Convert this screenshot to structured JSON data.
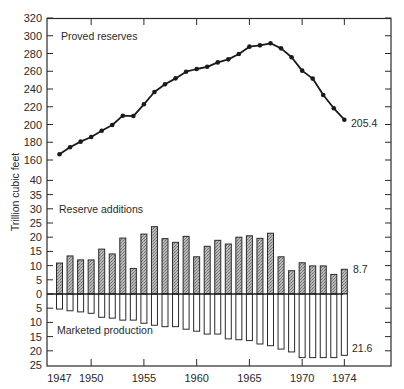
{
  "chart_data": {
    "type": "line+bar",
    "title": "",
    "ylabel": "Trillion cubic feet",
    "xlabel": "",
    "x_tick_labels": [
      "1947",
      "1950",
      "1955",
      "1960",
      "1965",
      "1970",
      "1974"
    ],
    "x": [
      1947,
      1948,
      1949,
      1950,
      1951,
      1952,
      1953,
      1954,
      1955,
      1956,
      1957,
      1958,
      1959,
      1960,
      1961,
      1962,
      1963,
      1964,
      1965,
      1966,
      1967,
      1968,
      1969,
      1970,
      1971,
      1972,
      1973,
      1974
    ],
    "upper_panel": {
      "label": "Proved reserves",
      "type": "line",
      "ylim": [
        160,
        320
      ],
      "y_ticks": [
        160,
        180,
        200,
        220,
        240,
        260,
        280,
        300,
        320
      ],
      "values": [
        166.4,
        174.3,
        180.7,
        185.9,
        193.0,
        199.4,
        209.9,
        209.5,
        222.8,
        236.6,
        245.3,
        252.0,
        259.5,
        262.5,
        265.0,
        270.0,
        273.4,
        279.4,
        287.7,
        289.2,
        291.5,
        285.8,
        275.7,
        260.7,
        251.7,
        233.2,
        218.3,
        205.4
      ],
      "end_label": "205.4"
    },
    "lower_panel": {
      "ylim": [
        -25,
        40
      ],
      "y_ticks": [
        40,
        35,
        30,
        25,
        20,
        15,
        10,
        5,
        0,
        5,
        10,
        15,
        20,
        25
      ],
      "series": [
        {
          "name": "Reserve additions",
          "type": "bar",
          "direction": "up",
          "fill": "hatched-gray",
          "values": [
            10.9,
            13.4,
            12.0,
            12.0,
            15.8,
            14.1,
            19.7,
            9.0,
            21.1,
            23.7,
            19.5,
            18.2,
            20.3,
            13.1,
            16.8,
            18.9,
            17.6,
            20.0,
            20.5,
            19.6,
            21.4,
            13.1,
            8.2,
            11.0,
            9.9,
            9.9,
            6.9,
            8.7
          ],
          "end_label": "8.7"
        },
        {
          "name": "Marketed production",
          "type": "bar",
          "direction": "down",
          "fill": "white",
          "values": [
            5.3,
            5.9,
            6.3,
            6.8,
            8.2,
            8.5,
            9.2,
            9.2,
            10.3,
            11.0,
            11.5,
            11.5,
            12.4,
            13.1,
            14.1,
            14.1,
            15.8,
            16.1,
            16.4,
            17.6,
            18.2,
            19.4,
            20.4,
            22.4,
            22.4,
            22.4,
            22.4,
            21.6
          ],
          "end_label": "21.6"
        }
      ]
    },
    "grid": false,
    "legend_position": "inline-labels"
  }
}
